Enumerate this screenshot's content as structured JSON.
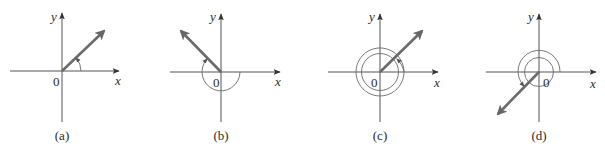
{
  "figure": {
    "axis_labels": {
      "x": "x",
      "y": "y",
      "origin": "0"
    },
    "colors": {
      "axis": "#555555",
      "ray": "#6b6b6b",
      "arc": "#6a6a6a",
      "text": "#2a2a2a",
      "background": "#ffffff"
    },
    "panels": [
      {
        "id": "a",
        "caption": "(a)",
        "ray_angle_deg": 45,
        "rotation": "counterclockwise, less than one revolution (positive acute angle)"
      },
      {
        "id": "b",
        "caption": "(b)",
        "ray_angle_deg": 135,
        "rotation": "clockwise through 225° (negative angle)"
      },
      {
        "id": "c",
        "caption": "(c)",
        "ray_angle_deg": 45,
        "rotation": "counterclockwise one full revolution plus 45° (405°)"
      },
      {
        "id": "d",
        "caption": "(d)",
        "ray_angle_deg": 225,
        "rotation": "clockwise more than one revolution"
      }
    ]
  }
}
